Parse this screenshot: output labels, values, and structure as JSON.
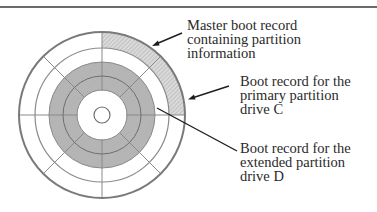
{
  "figure": {
    "title": ""
  },
  "labels": {
    "mbr": {
      "lines": [
        "Master boot record",
        "containing partition",
        "information"
      ]
    },
    "primary": {
      "lines": [
        "Boot record for the",
        "primary partition",
        "drive C"
      ]
    },
    "extended": {
      "lines": [
        "Boot record for the",
        "extended partition",
        "drive D"
      ]
    }
  },
  "colors": {
    "ink": "#2a2a2a",
    "ring_stroke": "#7a7a7a",
    "gray_fill": "#b4b4b4",
    "hatch_fill": "#d2d2d2"
  }
}
